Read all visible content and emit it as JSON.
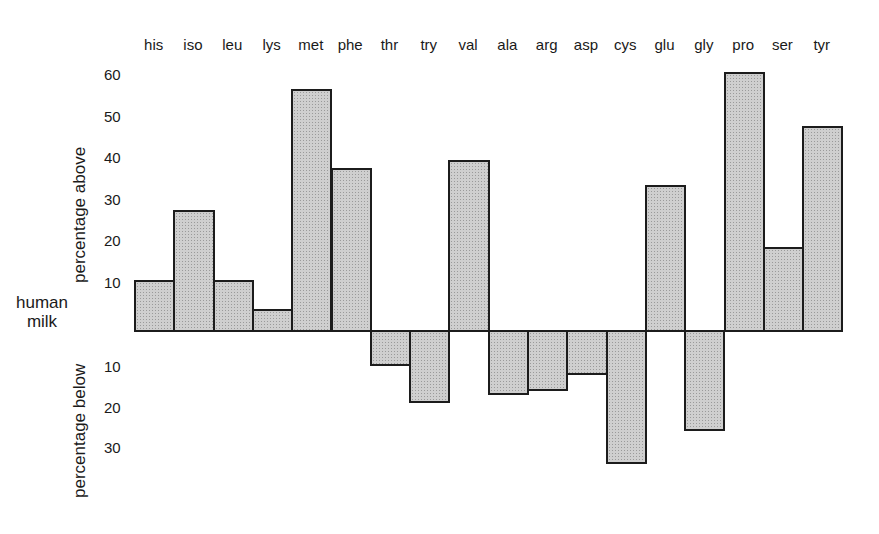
{
  "chart_data": {
    "type": "bar",
    "title": "",
    "xlabel": "",
    "ylabel_above": "percentage above",
    "ylabel_below": "percentage below",
    "baseline_label": [
      "human",
      "milk"
    ],
    "categories": [
      "his",
      "iso",
      "leu",
      "lys",
      "met",
      "phe",
      "thr",
      "try",
      "val",
      "ala",
      "arg",
      "asp",
      "cys",
      "glu",
      "gly",
      "pro",
      "ser",
      "tyr"
    ],
    "values": [
      11,
      28,
      11,
      4,
      57,
      38,
      -8,
      -17,
      40,
      -15,
      -14,
      -10,
      -32,
      34,
      -24,
      61,
      19,
      48
    ],
    "ticks_above": [
      10,
      20,
      30,
      40,
      50,
      60
    ],
    "ticks_below": [
      10,
      20,
      30
    ],
    "ylim": [
      -35,
      65
    ],
    "grid": false,
    "legend": null,
    "bar_fill": "#cfcfcf",
    "bar_edge": "#1c1c1c"
  }
}
